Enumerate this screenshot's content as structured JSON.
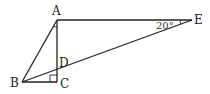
{
  "diagram": {
    "type": "geometry",
    "points": {
      "A": {
        "label": "A",
        "x": 57,
        "y": 20
      },
      "B": {
        "label": "B",
        "x": 22,
        "y": 82
      },
      "C": {
        "label": "C",
        "x": 57,
        "y": 82
      },
      "D": {
        "label": "D",
        "x": 57,
        "y": 70
      },
      "E": {
        "label": "E",
        "x": 192,
        "y": 20
      }
    },
    "segments": [
      "AB",
      "AC",
      "BC",
      "AE",
      "BE"
    ],
    "angle_label_E": "20°",
    "right_angle_at": "C",
    "stroke_color": "#222222"
  }
}
